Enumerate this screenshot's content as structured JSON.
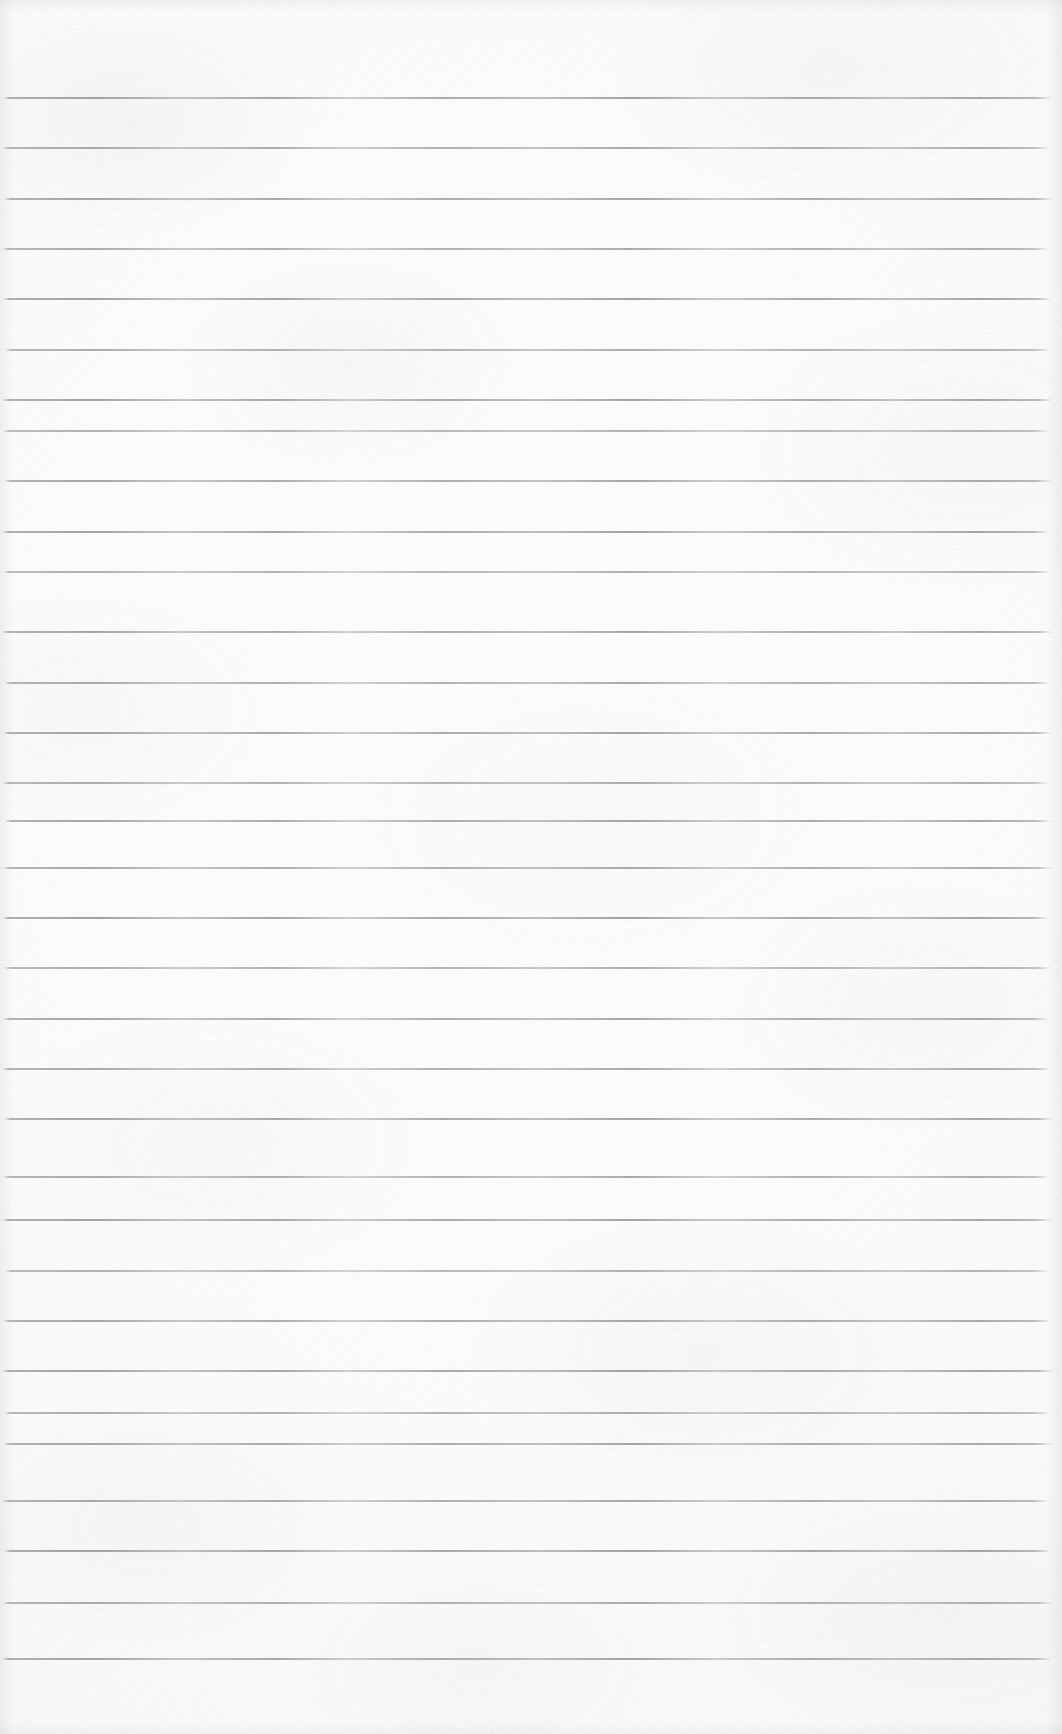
{
  "document": {
    "type": "scanned-lined-paper",
    "description": "Blank ruled notebook page scan",
    "page_width": 1062,
    "page_height": 1734,
    "content_text": "",
    "has_handwriting": false,
    "has_printed_text": false
  },
  "paper": {
    "background_color": "#fcfcfb",
    "highlight_color": "#fefefe",
    "shadow_color": "#f3f3f2",
    "texture": "fibrous-grain"
  },
  "ruling": {
    "line_color": "#8a8c8e",
    "line_color_faint": "#a9abad",
    "line_thickness_px": 2,
    "line_spacing_px": 50.4,
    "first_line_y": 97,
    "last_line_y": 1658,
    "line_count": 32,
    "left_margin_px": 2,
    "right_margin_px": 10,
    "style": "wide-ruled-horizontal",
    "margin_rule": "none",
    "lines": [
      {
        "index": 1,
        "y": 97,
        "x_start": 3,
        "x_end": 1052,
        "opacity": 0.86
      },
      {
        "index": 2,
        "y": 147,
        "x_start": 2,
        "x_end": 1050,
        "opacity": 0.8
      },
      {
        "index": 3,
        "y": 198,
        "x_start": 4,
        "x_end": 1053,
        "opacity": 0.84
      },
      {
        "index": 4,
        "y": 248,
        "x_start": 2,
        "x_end": 1049,
        "opacity": 0.78
      },
      {
        "index": 5,
        "y": 298,
        "x_start": 3,
        "x_end": 1052,
        "opacity": 0.88
      },
      {
        "index": 6,
        "y": 349,
        "x_start": 5,
        "x_end": 1051,
        "opacity": 0.76
      },
      {
        "index": 7,
        "y": 399,
        "x_start": 2,
        "x_end": 1053,
        "opacity": 0.85
      },
      {
        "index": 8,
        "y": 430,
        "x_start": 3,
        "x_end": 1050,
        "opacity": 0.72
      },
      {
        "index": 9,
        "y": 480,
        "x_start": 4,
        "x_end": 1052,
        "opacity": 0.82
      },
      {
        "index": 10,
        "y": 531,
        "x_start": 2,
        "x_end": 1049,
        "opacity": 0.87
      },
      {
        "index": 11,
        "y": 571,
        "x_start": 3,
        "x_end": 1051,
        "opacity": 0.74
      },
      {
        "index": 12,
        "y": 631,
        "x_start": 2,
        "x_end": 1053,
        "opacity": 0.83
      },
      {
        "index": 13,
        "y": 682,
        "x_start": 4,
        "x_end": 1050,
        "opacity": 0.79
      },
      {
        "index": 14,
        "y": 732,
        "x_start": 3,
        "x_end": 1052,
        "opacity": 0.86
      },
      {
        "index": 15,
        "y": 782,
        "x_start": 2,
        "x_end": 1049,
        "opacity": 0.77
      },
      {
        "index": 16,
        "y": 820,
        "x_start": 5,
        "x_end": 1051,
        "opacity": 0.84
      },
      {
        "index": 17,
        "y": 867,
        "x_start": 3,
        "x_end": 1053,
        "opacity": 0.81
      },
      {
        "index": 18,
        "y": 917,
        "x_start": 2,
        "x_end": 1050,
        "opacity": 0.88
      },
      {
        "index": 19,
        "y": 967,
        "x_start": 4,
        "x_end": 1052,
        "opacity": 0.75
      },
      {
        "index": 20,
        "y": 1018,
        "x_start": 3,
        "x_end": 1049,
        "opacity": 0.83
      },
      {
        "index": 21,
        "y": 1068,
        "x_start": 2,
        "x_end": 1051,
        "opacity": 0.8
      },
      {
        "index": 22,
        "y": 1118,
        "x_start": 4,
        "x_end": 1053,
        "opacity": 0.85
      },
      {
        "index": 23,
        "y": 1176,
        "x_start": 3,
        "x_end": 1050,
        "opacity": 0.78
      },
      {
        "index": 24,
        "y": 1219,
        "x_start": 2,
        "x_end": 1052,
        "opacity": 0.86
      },
      {
        "index": 25,
        "y": 1270,
        "x_start": 5,
        "x_end": 1049,
        "opacity": 0.73
      },
      {
        "index": 26,
        "y": 1320,
        "x_start": 3,
        "x_end": 1051,
        "opacity": 0.82
      },
      {
        "index": 27,
        "y": 1370,
        "x_start": 2,
        "x_end": 1053,
        "opacity": 0.87
      },
      {
        "index": 28,
        "y": 1412,
        "x_start": 4,
        "x_end": 1050,
        "opacity": 0.76
      },
      {
        "index": 29,
        "y": 1443,
        "x_start": 3,
        "x_end": 1052,
        "opacity": 0.84
      },
      {
        "index": 30,
        "y": 1500,
        "x_start": 2,
        "x_end": 1049,
        "opacity": 0.81
      },
      {
        "index": 31,
        "y": 1550,
        "x_start": 4,
        "x_end": 1051,
        "opacity": 0.88
      },
      {
        "index": 32,
        "y": 1602,
        "x_start": 3,
        "x_end": 1053,
        "opacity": 0.79
      },
      {
        "index": 33,
        "y": 1658,
        "x_start": 2,
        "x_end": 1052,
        "opacity": 0.85
      }
    ]
  }
}
